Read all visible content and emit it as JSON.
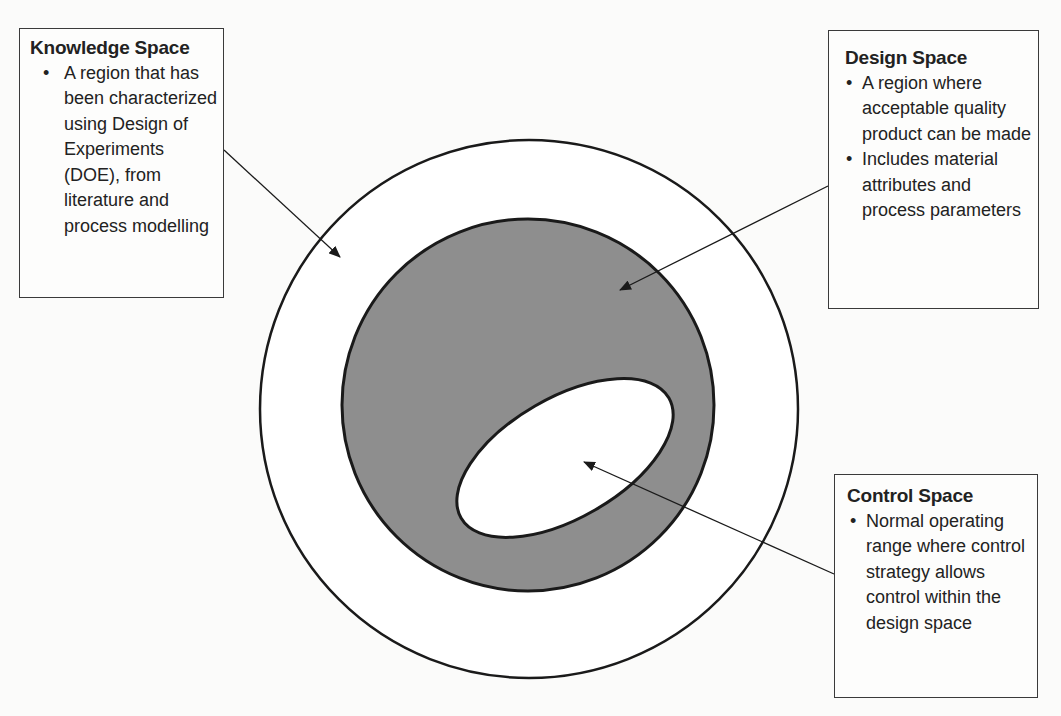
{
  "diagram": {
    "type": "nested-regions",
    "regions": [
      {
        "id": "knowledge_space",
        "shape": "circle",
        "fill": "#ffffff",
        "stroke": "#1a1a1a"
      },
      {
        "id": "design_space",
        "shape": "circle",
        "fill": "#8c8c8c",
        "stroke": "#1a1a1a"
      },
      {
        "id": "control_space",
        "shape": "ellipse",
        "fill": "#ffffff",
        "stroke": "#1a1a1a"
      }
    ]
  },
  "callouts": {
    "knowledge": {
      "title": "Knowledge Space",
      "bullets": [
        "A region that has been characterized using Design of Experiments (DOE), from literature and process modelling"
      ]
    },
    "design": {
      "title": "Design Space",
      "bullets": [
        "A region where acceptable quality product can be made",
        "Includes material attributes and process parameters"
      ]
    },
    "control": {
      "title": "Control Space",
      "bullets": [
        "Normal operating range where control strategy allows control within the design space"
      ]
    }
  }
}
